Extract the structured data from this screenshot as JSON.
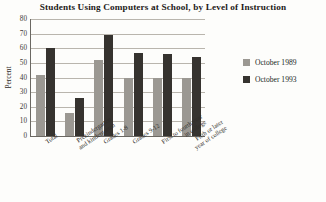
{
  "chart_data": {
    "type": "bar",
    "title": "Students Using Computers at School, by Level of Instruction",
    "xlabel": "",
    "ylabel": "Percent",
    "ylim": [
      0,
      80
    ],
    "yticks": [
      "0",
      "10",
      "20",
      "30",
      "40",
      "50",
      "60",
      "70",
      "80"
    ],
    "grid": true,
    "legend_position": "right",
    "categories": [
      "Total",
      "Prekindergarten and kindergarten",
      "Grades 1-8",
      "Grades 9-12",
      "First to fourth year in college",
      "Fifth or later year of college"
    ],
    "category_lines": [
      [
        "Total"
      ],
      [
        "Prekindergarten",
        "and kindergarten"
      ],
      [
        "Grades 1-8"
      ],
      [
        "Grades 9-12"
      ],
      [
        "First to fourth year",
        "in college"
      ],
      [
        "Fifth or later",
        "year of college"
      ]
    ],
    "series": [
      {
        "name": "October 1989",
        "color": "#9b9892",
        "values": [
          42,
          16,
          52,
          40,
          40,
          40
        ]
      },
      {
        "name": "October 1993",
        "color": "#36332f",
        "values": [
          60,
          26,
          69,
          57,
          56,
          54
        ]
      }
    ]
  },
  "legend": {
    "items": [
      {
        "label": "October 1989"
      },
      {
        "label": "October 1993"
      }
    ]
  }
}
